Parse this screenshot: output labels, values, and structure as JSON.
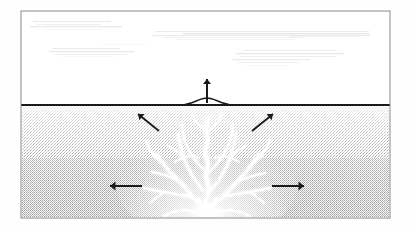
{
  "figure": {
    "type": "geological-cross-section",
    "medium": "scanned line drawing, halftone stipple shading",
    "frame": {
      "x": 21,
      "y": 11,
      "width": 369,
      "height": 207,
      "border_color": "#8a8a8a",
      "border_width": 1
    },
    "canvas": {
      "width": 412,
      "height": 230,
      "background": "#fefefe"
    }
  },
  "regions": [
    {
      "name": "sky-region",
      "label": "Air / above-ground",
      "fill": "#ffffff",
      "x": 22,
      "y": 12,
      "width": 367,
      "height": 93
    },
    {
      "name": "ground-region",
      "label": "Subsurface medium (stippled)",
      "fill_top": "#f2f2f2",
      "fill_bottom": "#c9c9c9",
      "x": 22,
      "y": 105,
      "width": 367,
      "height": 112
    }
  ],
  "surface_line": {
    "name": "ground-surface-line",
    "label": "Ground surface",
    "y": 105,
    "x_start": 22,
    "x_end": 389,
    "color": "#1a1a1a",
    "width": 2
  },
  "surface_mound": {
    "name": "surface-uplift-mound",
    "label": "Surface uplift / bulge",
    "center_x": 207,
    "half_width": 26,
    "height": 7,
    "color": "#1a1a1a"
  },
  "arrows": [
    {
      "id": "vertical-uplift-arrow",
      "label": "Vertical surface uplift",
      "direction": "up",
      "x1": 207,
      "y1": 103,
      "x2": 207,
      "y2": 79,
      "color": "#1a1a1a",
      "stroke": 2.0,
      "head": 5.0
    },
    {
      "id": "left-diagonal-arrow",
      "label": "Up-left subsurface displacement",
      "direction": "up-left",
      "x1": 159,
      "y1": 131,
      "x2": 138,
      "y2": 114,
      "color": "#1a1a1a",
      "stroke": 1.8,
      "head": 5.0
    },
    {
      "id": "right-diagonal-arrow",
      "label": "Up-right subsurface displacement",
      "direction": "up-right",
      "x1": 252,
      "y1": 131,
      "x2": 273,
      "y2": 114,
      "color": "#1a1a1a",
      "stroke": 1.8,
      "head": 5.0
    },
    {
      "id": "left-horizontal-arrow",
      "label": "Lateral left displacement",
      "direction": "left",
      "x1": 142,
      "y1": 186,
      "x2": 110,
      "y2": 186,
      "color": "#1a1a1a",
      "stroke": 2.0,
      "head": 5.5
    },
    {
      "id": "right-horizontal-arrow",
      "label": "Lateral right displacement",
      "direction": "right",
      "x1": 272,
      "y1": 186,
      "x2": 304,
      "y2": 186,
      "color": "#1a1a1a",
      "stroke": 2.0,
      "head": 5.5
    }
  ],
  "fracture_network": {
    "name": "fracture-plume",
    "label": "Branching white fracture / injection plume",
    "color": "#ffffff",
    "origin": {
      "x": 207,
      "y": 213
    },
    "apex": {
      "x": 207,
      "y": 118
    },
    "source_blob": {
      "cx": 207,
      "cy": 212,
      "rx": 19,
      "ry": 10
    },
    "branches": [
      {
        "id": "trunk-center",
        "points": "207,214 206,200 209,188 206,176 208,164 205,152 208,140 206,128 208,118",
        "width": 4.2
      },
      {
        "id": "branch-left-1",
        "points": "204,206 193,198 186,188 178,180 170,172 163,163 157,155",
        "width": 3.4
      },
      {
        "id": "branch-left-1a",
        "points": "178,180 170,177 161,174 152,172",
        "width": 2.2
      },
      {
        "id": "branch-left-1b",
        "points": "163,163 156,158 150,150 146,141",
        "width": 2.4
      },
      {
        "id": "branch-left-2",
        "points": "200,200 188,196 176,194 164,192 153,190 144,188",
        "width": 2.6
      },
      {
        "id": "branch-left-2a",
        "points": "164,192 157,197 150,203",
        "width": 1.8
      },
      {
        "id": "branch-left-3",
        "points": "203,190 195,180 188,168 183,156 180,144 178,134",
        "width": 2.8
      },
      {
        "id": "branch-left-3a",
        "points": "183,156 175,150 168,146",
        "width": 1.8
      },
      {
        "id": "branch-left-4",
        "points": "206,172 198,164 191,154 186,144 183,133 182,124",
        "width": 2.4
      },
      {
        "id": "branch-right-1",
        "points": "211,206 222,198 230,189 238,181 246,172 253,163 259,155",
        "width": 3.4
      },
      {
        "id": "branch-right-1a",
        "points": "238,181 247,178 256,175 265,173",
        "width": 2.2
      },
      {
        "id": "branch-right-1b",
        "points": "253,163 260,157 266,149 270,140",
        "width": 2.4
      },
      {
        "id": "branch-right-2",
        "points": "214,200 226,196 238,194 250,192 261,190 270,188",
        "width": 2.6
      },
      {
        "id": "branch-right-2a",
        "points": "250,192 257,197 264,203",
        "width": 1.8
      },
      {
        "id": "branch-right-3",
        "points": "211,190 219,180 226,168 231,156 234,144 236,134",
        "width": 2.8
      },
      {
        "id": "branch-right-3a",
        "points": "231,156 239,150 246,146",
        "width": 1.8
      },
      {
        "id": "branch-right-4",
        "points": "209,172 217,164 224,154 229,144 232,133 233,124",
        "width": 2.4
      },
      {
        "id": "branch-apex-left",
        "points": "207,132 200,126 195,120 192,114",
        "width": 2.0
      },
      {
        "id": "branch-apex-right",
        "points": "207,132 214,126 219,120 222,114",
        "width": 2.0
      },
      {
        "id": "branch-mid-left",
        "points": "199,158 190,156 182,158 175,162",
        "width": 1.7
      },
      {
        "id": "branch-mid-right",
        "points": "215,158 224,156 232,158 239,162",
        "width": 1.7
      },
      {
        "id": "branch-low-left",
        "points": "196,212 184,210 173,212 164,216",
        "width": 2.2
      },
      {
        "id": "branch-low-right",
        "points": "218,212 230,210 241,212 250,216",
        "width": 2.2
      }
    ]
  },
  "cloud_streaks": {
    "name": "sky-streak-artifacts",
    "label": "Faint horizontal scan streaks in sky area",
    "color": "#d8d8d8",
    "lines": [
      {
        "x": 33,
        "y": 21,
        "w": 78,
        "h": 1.0,
        "o": 0.55
      },
      {
        "x": 37,
        "y": 24,
        "w": 64,
        "h": 0.9,
        "o": 0.45
      },
      {
        "x": 30,
        "y": 26,
        "w": 92,
        "h": 1.2,
        "o": 0.6
      },
      {
        "x": 45,
        "y": 29,
        "w": 56,
        "h": 0.8,
        "o": 0.35
      },
      {
        "x": 155,
        "y": 31,
        "w": 214,
        "h": 1.0,
        "o": 0.5
      },
      {
        "x": 183,
        "y": 33,
        "w": 186,
        "h": 1.3,
        "o": 0.62
      },
      {
        "x": 152,
        "y": 35,
        "w": 218,
        "h": 1.1,
        "o": 0.55
      },
      {
        "x": 163,
        "y": 37,
        "w": 140,
        "h": 0.9,
        "o": 0.4
      },
      {
        "x": 175,
        "y": 39,
        "w": 120,
        "h": 0.8,
        "o": 0.33
      },
      {
        "x": 52,
        "y": 48,
        "w": 68,
        "h": 1.0,
        "o": 0.48
      },
      {
        "x": 49,
        "y": 51,
        "w": 86,
        "h": 1.2,
        "o": 0.58
      },
      {
        "x": 55,
        "y": 54,
        "w": 72,
        "h": 0.9,
        "o": 0.42
      },
      {
        "x": 62,
        "y": 56,
        "w": 52,
        "h": 0.8,
        "o": 0.3
      },
      {
        "x": 243,
        "y": 50,
        "w": 92,
        "h": 1.0,
        "o": 0.5
      },
      {
        "x": 236,
        "y": 53,
        "w": 108,
        "h": 1.2,
        "o": 0.58
      },
      {
        "x": 240,
        "y": 56,
        "w": 96,
        "h": 1.0,
        "o": 0.46
      },
      {
        "x": 232,
        "y": 59,
        "w": 78,
        "h": 1.1,
        "o": 0.52
      },
      {
        "x": 238,
        "y": 62,
        "w": 62,
        "h": 0.9,
        "o": 0.38
      },
      {
        "x": 245,
        "y": 65,
        "w": 44,
        "h": 0.8,
        "o": 0.28
      },
      {
        "x": 100,
        "y": 44,
        "w": 48,
        "h": 0.7,
        "o": 0.22
      },
      {
        "x": 290,
        "y": 36,
        "w": 70,
        "h": 0.8,
        "o": 0.3
      }
    ]
  },
  "colors": {
    "ink": "#1a1a1a",
    "frame": "#8a8a8a",
    "ground_light": "#f2f2f2",
    "ground_dark": "#c9c9c9",
    "fracture": "#ffffff",
    "streak": "#d8d8d8",
    "page": "#fefefe"
  }
}
